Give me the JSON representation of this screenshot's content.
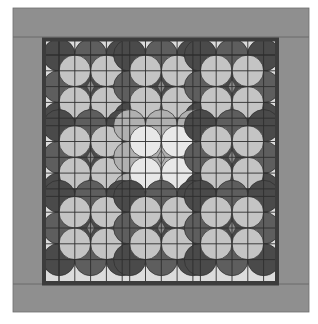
{
  "image": {
    "subject": "quilt pattern illustration",
    "width": 318,
    "height": 324
  },
  "quilt": {
    "outer_border": {
      "x": 13,
      "y": 8,
      "right": 309,
      "bottom": 312,
      "color": "#8f8f8f",
      "seam_top": 37,
      "seam_bottom": 284,
      "seam_left": 42,
      "seam_right": 279
    },
    "inner_frame": {
      "x": 42,
      "y": 38,
      "right": 279,
      "bottom": 285,
      "thickness": 4,
      "color": "#3c3c3c"
    },
    "field": {
      "x": 46,
      "y": 41,
      "right": 275,
      "bottom": 281
    },
    "edge_strip": {
      "width": 13,
      "color": "#d8d8d8"
    },
    "cell_size": 15.8,
    "block_cells": 4,
    "sashing_width": 7.5,
    "blocks_per_side": 3,
    "block_origin": {
      "x": 59,
      "y": 55
    },
    "colors": {
      "grid_line": "#2e2e2e",
      "light_strip": "#dcdcdc",
      "white": "#f6f6f6",
      "sash_cross": "#555555",
      "dark_arc": "#4a4a4a",
      "dark_arc_alt": "#5e5e5e",
      "pillow_light": "#c4c4c4",
      "center_arc": "#b0b0b0",
      "center_pillow": "#e8e8e8",
      "diamond": "#8a8a8a"
    },
    "center_block": {
      "row": 1,
      "col": 1,
      "style": "light"
    }
  }
}
